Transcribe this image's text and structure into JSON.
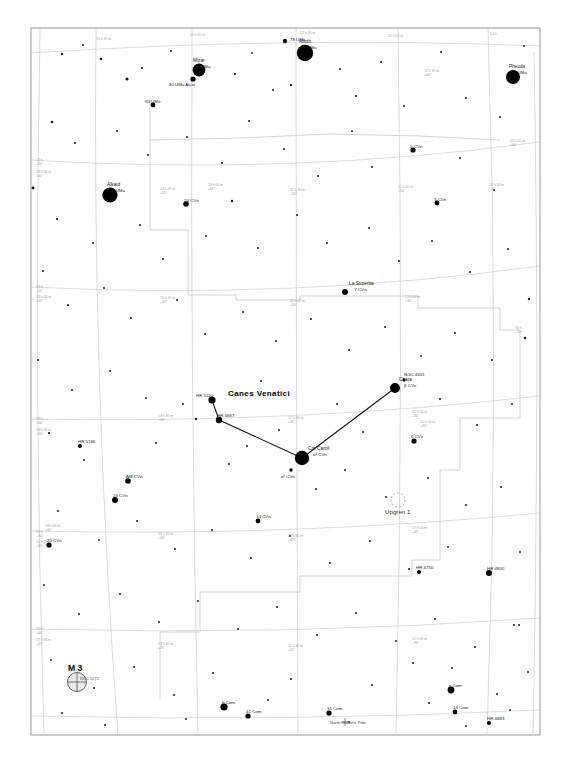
{
  "chart": {
    "type": "star-chart",
    "title": "Canes Venatici",
    "frame": {
      "x": 31,
      "y": 28,
      "w": 509,
      "h": 707
    },
    "background": "#ffffff",
    "ink": "#000000",
    "grid_color": "#b9b9b9",
    "boundary_color": "#c9c9c9"
  },
  "constellation": {
    "name": "Canes Venatici",
    "label_x": 228,
    "label_y": 394
  },
  "grid": {
    "ra_label_prefix": "",
    "dec_labels": [
      "+60°",
      "+55°",
      "+50°",
      "+45°",
      "+40°",
      "+35°",
      "+30°",
      "+25°",
      "+20°"
    ],
    "ra_labels": [
      "13 h 30 m",
      "13 h 00 m",
      "12 h 30 m",
      "12 h 00 m",
      "14 h 00 m"
    ],
    "ticks": [
      {
        "x": 36,
        "y": 159,
        "t1": "13 h",
        "t2": "+60°"
      },
      {
        "x": 36,
        "y": 171,
        "t1": "13 h 30 m",
        "t2": "+60°"
      },
      {
        "x": 36,
        "y": 286,
        "t1": "13 h",
        "t2": "+55°"
      },
      {
        "x": 36,
        "y": 296,
        "t1": "13 h 30 m",
        "t2": "+55°"
      },
      {
        "x": 36,
        "y": 418,
        "t1": "13 h",
        "t2": "+50°"
      },
      {
        "x": 36,
        "y": 429,
        "t1": "13 h 30 m",
        "t2": "+50°"
      },
      {
        "x": 36,
        "y": 531,
        "t1": "13 h",
        "t2": "+45°"
      },
      {
        "x": 36,
        "y": 541,
        "t1": "13 h 30 m",
        "t2": "+45°"
      },
      {
        "x": 36,
        "y": 628,
        "t1": "13 h",
        "t2": "+40°"
      },
      {
        "x": 36,
        "y": 639,
        "t1": "13 h 30 m",
        "t2": "+40°"
      },
      {
        "x": 96,
        "y": 38,
        "t1": "13 h 30 m",
        "t2": ""
      },
      {
        "x": 190,
        "y": 34,
        "t1": "13 h 00 m",
        "t2": ""
      },
      {
        "x": 300,
        "y": 32,
        "t1": "12 h 30 m",
        "t2": ""
      },
      {
        "x": 388,
        "y": 35,
        "t1": "12 h 00 m",
        "t2": ""
      },
      {
        "x": 490,
        "y": 33,
        "t1": "14 h",
        "t2": ""
      },
      {
        "x": 160,
        "y": 188,
        "t1": "13 h 30 m",
        "t2": "+55°"
      },
      {
        "x": 208,
        "y": 184,
        "t1": "13 h 00 m",
        "t2": "+55°"
      },
      {
        "x": 290,
        "y": 189,
        "t1": "12 h 30 m",
        "t2": "+55°"
      },
      {
        "x": 398,
        "y": 186,
        "t1": "12 h 00 m",
        "t2": "+55°"
      },
      {
        "x": 489,
        "y": 184,
        "t1": "14 h 00 m",
        "t2": "+55°"
      },
      {
        "x": 160,
        "y": 297,
        "t1": "13 h 30 m",
        "t2": "+50°"
      },
      {
        "x": 290,
        "y": 300,
        "t1": "12 h 30 m",
        "t2": "+50°"
      },
      {
        "x": 405,
        "y": 296,
        "t1": "12 h 00 m",
        "t2": "+50°"
      },
      {
        "x": 158,
        "y": 415,
        "t1": "13 h 30 m",
        "t2": "+45°"
      },
      {
        "x": 288,
        "y": 417,
        "t1": "12 h 30 m",
        "t2": "+45°"
      },
      {
        "x": 412,
        "y": 411,
        "t1": "12 h 00 m",
        "t2": "+45°"
      },
      {
        "x": 158,
        "y": 533,
        "t1": "13 h 30 m",
        "t2": "+40°"
      },
      {
        "x": 288,
        "y": 535,
        "t1": "12 h 30 m",
        "t2": "+40°"
      },
      {
        "x": 412,
        "y": 527,
        "t1": "12 h 00 m",
        "t2": "+40°"
      },
      {
        "x": 158,
        "y": 643,
        "t1": "13 h 30 m",
        "t2": "+35°"
      },
      {
        "x": 288,
        "y": 645,
        "t1": "12 h 30 m",
        "t2": "+35°"
      },
      {
        "x": 412,
        "y": 638,
        "t1": "12 h 00 m",
        "t2": "+35°"
      },
      {
        "x": 424,
        "y": 70,
        "t1": "12 h 30 m",
        "t2": "+60°"
      },
      {
        "x": 510,
        "y": 140,
        "t1": "14 h 00 m",
        "t2": "+60°"
      },
      {
        "x": 515,
        "y": 327,
        "t1": "14 h",
        "t2": "+50°"
      },
      {
        "x": 420,
        "y": 421,
        "t1": "12 h 00 m",
        "t2": "+45°"
      },
      {
        "x": 45,
        "y": 525,
        "t1": "13 h 30 m",
        "t2": "+40°"
      }
    ]
  },
  "stars": [
    {
      "name": "Alioth",
      "bayer": "ε UMa",
      "x": 305,
      "y": 53,
      "mag": 1.8,
      "r": 8.2,
      "label_dx": -6,
      "label_dy": -14
    },
    {
      "name": "Phecda",
      "bayer": "γ UMa",
      "x": 513,
      "y": 77,
      "mag": 2.4,
      "r": 7.0,
      "label_dx": -4,
      "label_dy": -13
    },
    {
      "name": "Alkaid",
      "bayer": "η UMa",
      "x": 110,
      "y": 195,
      "mag": 1.9,
      "r": 7.6,
      "label_dx": -3,
      "label_dy": -13
    },
    {
      "name": "Mizar",
      "bayer": "ζ UMa",
      "x": 199,
      "y": 70,
      "mag": 2.2,
      "r": 6.4,
      "label_dx": -6,
      "label_dy": -12
    },
    {
      "name": "",
      "bayer": "80 UMa Alcor",
      "x": 193,
      "y": 79,
      "mag": 4.0,
      "r": 2.6,
      "label_dx": -24,
      "label_dy": 3
    },
    {
      "name": "",
      "bayer": "78 UMa",
      "x": 285,
      "y": 41,
      "mag": 4.9,
      "r": 2.2,
      "label_dx": 5,
      "label_dy": -4
    },
    {
      "name": "",
      "bayer": "83 UMa",
      "x": 153,
      "y": 105,
      "mag": 4.6,
      "r": 2.4,
      "label_dx": -8,
      "label_dy": -6
    },
    {
      "name": "",
      "bayer": "24 CVn",
      "x": 186,
      "y": 204,
      "mag": 4.7,
      "r": 2.8,
      "label_dx": -2,
      "label_dy": -6
    },
    {
      "name": "",
      "bayer": "5 CVn",
      "x": 413,
      "y": 150,
      "mag": 4.8,
      "r": 2.6,
      "label_dx": -3,
      "label_dy": -6
    },
    {
      "name": "",
      "bayer": "3 CVn",
      "x": 437,
      "y": 203,
      "mag": 5.3,
      "r": 2.4,
      "label_dx": -3,
      "label_dy": -6
    },
    {
      "name": "La Superba",
      "bayer": "Y CVn",
      "x": 345,
      "y": 292,
      "mag": 5.2,
      "r": 3.0,
      "label_dx": 4,
      "label_dy": -11
    },
    {
      "name": "Chara",
      "bayer": "β CVn",
      "x": 395,
      "y": 388,
      "mag": 4.2,
      "r": 5.0,
      "label_dx": 4,
      "label_dy": -11
    },
    {
      "name": "",
      "bayer": "NGC 4631",
      "x": 404,
      "y": 380,
      "mag": 9.0,
      "r": 1.6,
      "label_dx": 0,
      "label_dy": -8
    },
    {
      "name": "Cor Caroli",
      "bayer": "α² CVn",
      "x": 302,
      "y": 458,
      "mag": 2.9,
      "r": 7.2,
      "label_dx": 6,
      "label_dy": -12
    },
    {
      "name": "",
      "bayer": "α¹ CVn",
      "x": 291,
      "y": 470,
      "mag": 5.6,
      "r": 1.7,
      "label_dx": -10,
      "label_dy": 4
    },
    {
      "name": "",
      "bayer": "HR 4867",
      "x": 219,
      "y": 420,
      "mag": 4.9,
      "r": 3.2,
      "label_dx": -2,
      "label_dy": -7
    },
    {
      "name": "",
      "bayer": "HR 5110",
      "x": 212,
      "y": 400,
      "mag": 5.0,
      "r": 3.6,
      "label_dx": -16,
      "label_dy": -7
    },
    {
      "name": "",
      "bayer": "HR 5186",
      "x": 80,
      "y": 446,
      "mag": 5.2,
      "r": 2.0,
      "label_dx": -2,
      "label_dy": -7
    },
    {
      "name": "",
      "bayer": "AM CVn",
      "x": 128,
      "y": 481,
      "mag": 5.6,
      "r": 2.8,
      "label_dx": -2,
      "label_dy": -7
    },
    {
      "name": "",
      "bayer": "25 CVn",
      "x": 115,
      "y": 500,
      "mag": 4.8,
      "r": 3.0,
      "label_dx": -2,
      "label_dy": -7
    },
    {
      "name": "",
      "bayer": "20 CVn",
      "x": 49,
      "y": 545,
      "mag": 4.7,
      "r": 2.6,
      "label_dx": -2,
      "label_dy": -7
    },
    {
      "name": "",
      "bayer": "14 CVn",
      "x": 258,
      "y": 521,
      "mag": 5.2,
      "r": 2.4,
      "label_dx": -2,
      "label_dy": -7
    },
    {
      "name": "",
      "bayer": "6 CVn",
      "x": 414,
      "y": 441,
      "mag": 5.0,
      "r": 2.6,
      "label_dx": -3,
      "label_dy": -7
    },
    {
      "name": "",
      "bayer": "HR 4750",
      "x": 419,
      "y": 572,
      "mag": 5.5,
      "r": 2.0,
      "label_dx": -3,
      "label_dy": -7
    },
    {
      "name": "",
      "bayer": "HR 4800",
      "x": 489,
      "y": 573,
      "mag": 4.9,
      "r": 3.0,
      "label_dx": -2,
      "label_dy": -7
    },
    {
      "name": "",
      "bayer": "β Com",
      "x": 224,
      "y": 707,
      "mag": 4.2,
      "r": 3.6,
      "label_dx": -2,
      "label_dy": -7
    },
    {
      "name": "",
      "bayer": "41 Com",
      "x": 248,
      "y": 716,
      "mag": 4.8,
      "r": 2.6,
      "label_dx": -2,
      "label_dy": -7
    },
    {
      "name": "",
      "bayer": "31 Com",
      "x": 329,
      "y": 713,
      "mag": 4.9,
      "r": 2.6,
      "label_dx": -2,
      "label_dy": -7
    },
    {
      "name": "",
      "bayer": "γ Com",
      "x": 451,
      "y": 690,
      "mag": 4.4,
      "r": 3.4,
      "label_dx": -2,
      "label_dy": -7
    },
    {
      "name": "",
      "bayer": "14 Com",
      "x": 455,
      "y": 712,
      "mag": 4.9,
      "r": 2.4,
      "label_dx": -2,
      "label_dy": -7
    },
    {
      "name": "",
      "bayer": "HR 4883",
      "x": 489,
      "y": 723,
      "mag": 5.4,
      "r": 2.0,
      "label_dx": -2,
      "label_dy": -7
    }
  ],
  "faint_stars": [
    {
      "x": 62,
      "y": 54,
      "r": 1.2
    },
    {
      "x": 83,
      "y": 45,
      "r": 1.0
    },
    {
      "x": 101,
      "y": 59,
      "r": 1.3
    },
    {
      "x": 127,
      "y": 79,
      "r": 1.6
    },
    {
      "x": 142,
      "y": 68,
      "r": 1.1
    },
    {
      "x": 171,
      "y": 51,
      "r": 1.0
    },
    {
      "x": 235,
      "y": 74,
      "r": 1.1
    },
    {
      "x": 252,
      "y": 53,
      "r": 0.9
    },
    {
      "x": 273,
      "y": 90,
      "r": 1.0
    },
    {
      "x": 291,
      "y": 85,
      "r": 1.2
    },
    {
      "x": 340,
      "y": 69,
      "r": 1.0
    },
    {
      "x": 356,
      "y": 96,
      "r": 1.1
    },
    {
      "x": 381,
      "y": 62,
      "r": 1.0
    },
    {
      "x": 404,
      "y": 106,
      "r": 1.0
    },
    {
      "x": 441,
      "y": 52,
      "r": 1.0
    },
    {
      "x": 466,
      "y": 98,
      "r": 1.1
    },
    {
      "x": 500,
      "y": 117,
      "r": 1.0
    },
    {
      "x": 524,
      "y": 46,
      "r": 1.0
    },
    {
      "x": 52,
      "y": 122,
      "r": 1.3
    },
    {
      "x": 75,
      "y": 143,
      "r": 1.1
    },
    {
      "x": 117,
      "y": 131,
      "r": 1.0
    },
    {
      "x": 148,
      "y": 155,
      "r": 1.0
    },
    {
      "x": 187,
      "y": 137,
      "r": 1.0
    },
    {
      "x": 222,
      "y": 163,
      "r": 1.1
    },
    {
      "x": 249,
      "y": 121,
      "r": 1.0
    },
    {
      "x": 284,
      "y": 149,
      "r": 1.0
    },
    {
      "x": 318,
      "y": 176,
      "r": 1.0
    },
    {
      "x": 352,
      "y": 131,
      "r": 1.0
    },
    {
      "x": 372,
      "y": 167,
      "r": 1.0
    },
    {
      "x": 460,
      "y": 158,
      "r": 1.0
    },
    {
      "x": 494,
      "y": 190,
      "r": 1.0
    },
    {
      "x": 33,
      "y": 188,
      "r": 1.4
    },
    {
      "x": 57,
      "y": 219,
      "r": 1.1
    },
    {
      "x": 93,
      "y": 243,
      "r": 1.0
    },
    {
      "x": 140,
      "y": 225,
      "r": 1.0
    },
    {
      "x": 163,
      "y": 259,
      "r": 1.0
    },
    {
      "x": 206,
      "y": 236,
      "r": 1.0
    },
    {
      "x": 232,
      "y": 201,
      "r": 1.2
    },
    {
      "x": 258,
      "y": 248,
      "r": 1.0
    },
    {
      "x": 297,
      "y": 215,
      "r": 1.0
    },
    {
      "x": 327,
      "y": 243,
      "r": 1.0
    },
    {
      "x": 369,
      "y": 228,
      "r": 1.0
    },
    {
      "x": 399,
      "y": 261,
      "r": 1.0
    },
    {
      "x": 432,
      "y": 241,
      "r": 1.0
    },
    {
      "x": 470,
      "y": 272,
      "r": 1.0
    },
    {
      "x": 508,
      "y": 249,
      "r": 1.0
    },
    {
      "x": 529,
      "y": 299,
      "r": 1.2
    },
    {
      "x": 43,
      "y": 271,
      "r": 1.0
    },
    {
      "x": 68,
      "y": 305,
      "r": 1.1
    },
    {
      "x": 104,
      "y": 288,
      "r": 1.0
    },
    {
      "x": 131,
      "y": 318,
      "r": 1.0
    },
    {
      "x": 177,
      "y": 300,
      "r": 1.0
    },
    {
      "x": 205,
      "y": 334,
      "r": 1.0
    },
    {
      "x": 243,
      "y": 312,
      "r": 1.0
    },
    {
      "x": 276,
      "y": 341,
      "r": 1.0
    },
    {
      "x": 311,
      "y": 319,
      "r": 1.0
    },
    {
      "x": 349,
      "y": 350,
      "r": 1.0
    },
    {
      "x": 385,
      "y": 327,
      "r": 1.0
    },
    {
      "x": 421,
      "y": 356,
      "r": 1.0
    },
    {
      "x": 455,
      "y": 333,
      "r": 1.0
    },
    {
      "x": 492,
      "y": 360,
      "r": 1.0
    },
    {
      "x": 525,
      "y": 338,
      "r": 1.3
    },
    {
      "x": 38,
      "y": 360,
      "r": 1.0
    },
    {
      "x": 72,
      "y": 390,
      "r": 1.0
    },
    {
      "x": 110,
      "y": 371,
      "r": 1.0
    },
    {
      "x": 146,
      "y": 398,
      "r": 1.0
    },
    {
      "x": 183,
      "y": 404,
      "r": 1.0
    },
    {
      "x": 196,
      "y": 419,
      "r": 1.2
    },
    {
      "x": 261,
      "y": 381,
      "r": 1.0
    },
    {
      "x": 279,
      "y": 430,
      "r": 1.0
    },
    {
      "x": 337,
      "y": 404,
      "r": 1.0
    },
    {
      "x": 363,
      "y": 432,
      "r": 1.0
    },
    {
      "x": 440,
      "y": 399,
      "r": 1.1
    },
    {
      "x": 477,
      "y": 425,
      "r": 1.0
    },
    {
      "x": 512,
      "y": 404,
      "r": 1.0
    },
    {
      "x": 49,
      "y": 433,
      "r": 1.1
    },
    {
      "x": 84,
      "y": 460,
      "r": 1.0
    },
    {
      "x": 156,
      "y": 443,
      "r": 1.0
    },
    {
      "x": 229,
      "y": 464,
      "r": 1.0
    },
    {
      "x": 247,
      "y": 446,
      "r": 1.0
    },
    {
      "x": 316,
      "y": 489,
      "r": 1.0
    },
    {
      "x": 345,
      "y": 470,
      "r": 1.0
    },
    {
      "x": 386,
      "y": 497,
      "r": 1.0
    },
    {
      "x": 428,
      "y": 478,
      "r": 1.0
    },
    {
      "x": 466,
      "y": 505,
      "r": 1.0
    },
    {
      "x": 501,
      "y": 487,
      "r": 1.0
    },
    {
      "x": 58,
      "y": 511,
      "r": 1.0
    },
    {
      "x": 99,
      "y": 540,
      "r": 1.0
    },
    {
      "x": 137,
      "y": 521,
      "r": 1.0
    },
    {
      "x": 175,
      "y": 549,
      "r": 1.0
    },
    {
      "x": 212,
      "y": 530,
      "r": 1.0
    },
    {
      "x": 251,
      "y": 558,
      "r": 1.0
    },
    {
      "x": 290,
      "y": 536,
      "r": 1.0
    },
    {
      "x": 330,
      "y": 563,
      "r": 1.0
    },
    {
      "x": 370,
      "y": 541,
      "r": 1.0
    },
    {
      "x": 409,
      "y": 569,
      "r": 1.0
    },
    {
      "x": 448,
      "y": 547,
      "r": 1.0
    },
    {
      "x": 487,
      "y": 574,
      "r": 1.0
    },
    {
      "x": 520,
      "y": 552,
      "r": 1.0
    },
    {
      "x": 44,
      "y": 585,
      "r": 1.0
    },
    {
      "x": 79,
      "y": 614,
      "r": 1.0
    },
    {
      "x": 120,
      "y": 594,
      "r": 1.0
    },
    {
      "x": 159,
      "y": 622,
      "r": 1.0
    },
    {
      "x": 198,
      "y": 601,
      "r": 1.0
    },
    {
      "x": 238,
      "y": 629,
      "r": 1.0
    },
    {
      "x": 277,
      "y": 607,
      "r": 1.0
    },
    {
      "x": 317,
      "y": 635,
      "r": 1.0
    },
    {
      "x": 356,
      "y": 613,
      "r": 1.0
    },
    {
      "x": 396,
      "y": 641,
      "r": 1.0
    },
    {
      "x": 435,
      "y": 619,
      "r": 1.0
    },
    {
      "x": 475,
      "y": 647,
      "r": 1.0
    },
    {
      "x": 514,
      "y": 625,
      "r": 1.0
    },
    {
      "x": 51,
      "y": 660,
      "r": 1.0
    },
    {
      "x": 94,
      "y": 688,
      "r": 1.0
    },
    {
      "x": 134,
      "y": 667,
      "r": 1.0
    },
    {
      "x": 174,
      "y": 695,
      "r": 1.0
    },
    {
      "x": 213,
      "y": 673,
      "r": 1.0
    },
    {
      "x": 291,
      "y": 679,
      "r": 1.0
    },
    {
      "x": 372,
      "y": 685,
      "r": 1.0
    },
    {
      "x": 413,
      "y": 663,
      "r": 1.0
    },
    {
      "x": 452,
      "y": 668,
      "r": 1.0
    },
    {
      "x": 497,
      "y": 694,
      "r": 1.0
    },
    {
      "x": 528,
      "y": 672,
      "r": 1.0
    },
    {
      "x": 62,
      "y": 713,
      "r": 1.0
    },
    {
      "x": 105,
      "y": 725,
      "r": 1.0
    },
    {
      "x": 186,
      "y": 719,
      "r": 1.0
    },
    {
      "x": 268,
      "y": 700,
      "r": 1.0
    },
    {
      "x": 349,
      "y": 722,
      "r": 1.0
    },
    {
      "x": 429,
      "y": 703,
      "r": 1.0
    },
    {
      "x": 466,
      "y": 726,
      "r": 1.0
    },
    {
      "x": 510,
      "y": 710,
      "r": 1.0
    },
    {
      "x": 519,
      "y": 625,
      "r": 1.0
    }
  ],
  "deep_sky": [
    {
      "kind": "globular-cluster",
      "name": "M 3",
      "sub": "NGC 5272",
      "x": 77,
      "y": 682,
      "r": 9.5
    },
    {
      "kind": "open-cluster",
      "name": "Upgren 1",
      "sub": "",
      "x": 398,
      "y": 500,
      "r": 7.0
    }
  ],
  "markers": [
    {
      "kind": "north-galactic-pole",
      "name": "North Galactic Pole",
      "x": 345,
      "y": 722
    }
  ],
  "constellation_lines": [
    {
      "from": "HR 5110",
      "x1": 212,
      "y1": 400,
      "x2": 219,
      "y2": 420
    },
    {
      "from": "HR 4867",
      "x1": 219,
      "y1": 420,
      "x2": 302,
      "y2": 458
    },
    {
      "from": "Cor Caroli",
      "x1": 302,
      "y1": 458,
      "x2": 395,
      "y2": 388
    }
  ],
  "legend": {
    "caption": "Canes Venatici — The Hunting Dogs"
  }
}
